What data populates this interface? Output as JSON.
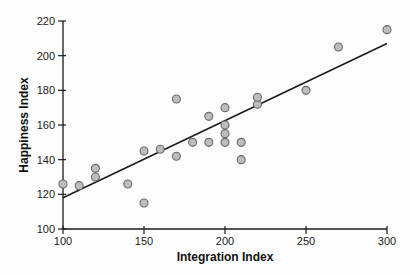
{
  "chart_data": {
    "type": "scatter",
    "title": "",
    "xlabel": "Integration Index",
    "ylabel": "Happiness Index",
    "xlim": [
      100,
      300
    ],
    "ylim": [
      100,
      220
    ],
    "x_ticks": [
      100,
      150,
      200,
      250,
      300
    ],
    "y_ticks": [
      100,
      120,
      140,
      160,
      180,
      200,
      220
    ],
    "grid": false,
    "legend": "none",
    "points": [
      [
        100,
        126
      ],
      [
        110,
        125
      ],
      [
        120,
        130
      ],
      [
        120,
        135
      ],
      [
        140,
        126
      ],
      [
        150,
        115
      ],
      [
        150,
        145
      ],
      [
        160,
        146
      ],
      [
        170,
        142
      ],
      [
        170,
        175
      ],
      [
        180,
        150
      ],
      [
        190,
        150
      ],
      [
        190,
        165
      ],
      [
        200,
        150
      ],
      [
        200,
        155
      ],
      [
        200,
        160
      ],
      [
        200,
        170
      ],
      [
        210,
        140
      ],
      [
        210,
        150
      ],
      [
        220,
        172
      ],
      [
        220,
        176
      ],
      [
        250,
        180
      ],
      [
        270,
        205
      ],
      [
        300,
        215
      ]
    ],
    "trend_line": {
      "x1": 100,
      "y1": 118,
      "x2": 300,
      "y2": 207
    },
    "colors": {
      "point_fill": "#bdbdbd",
      "point_stroke": "#696969",
      "axis": "#1a1a1a",
      "trend": "#1a1a1a",
      "tick_text": "#1a1a1a",
      "background": "#fdfdfd"
    },
    "point_radius": 4
  }
}
